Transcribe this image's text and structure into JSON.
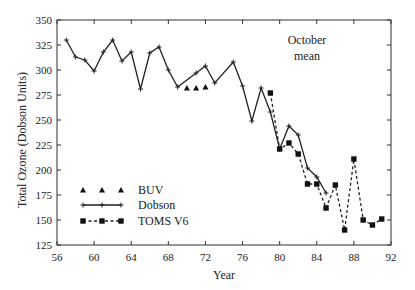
{
  "chart_data": {
    "type": "line",
    "title": "",
    "annotation": [
      "October",
      "mean"
    ],
    "xlabel": "Year",
    "ylabel": "Total Ozone (Dobson Units)",
    "xlim": [
      56,
      92
    ],
    "ylim": [
      125,
      350
    ],
    "xticks": [
      56,
      60,
      64,
      68,
      72,
      76,
      80,
      84,
      88,
      92
    ],
    "yticks": [
      125,
      150,
      175,
      200,
      225,
      250,
      275,
      300,
      325,
      350
    ],
    "grid": false,
    "legend_position": "lower-left",
    "series": [
      {
        "name": "BUV",
        "style": "markers-triangle",
        "x": [
          70,
          71,
          72
        ],
        "values": [
          282,
          282,
          283
        ]
      },
      {
        "name": "Dobson",
        "style": "solid-plus",
        "x": [
          57,
          58,
          59,
          60,
          61,
          62,
          63,
          64,
          65,
          66,
          67,
          68,
          69,
          71,
          72,
          73,
          75,
          76,
          77,
          78,
          79,
          80,
          81,
          82,
          83,
          84,
          85
        ],
        "values": [
          330,
          313,
          310,
          299,
          318,
          330,
          309,
          318,
          281,
          317,
          323,
          300,
          283,
          297,
          304,
          287,
          308,
          284,
          249,
          282,
          258,
          221,
          244,
          235,
          202,
          193,
          177
        ]
      },
      {
        "name": "TOMS V6",
        "style": "dashed-square",
        "x": [
          79,
          80,
          81,
          82,
          83,
          84,
          85,
          86,
          87,
          88,
          89,
          90,
          91
        ],
        "values": [
          277,
          221,
          227,
          216,
          186,
          186,
          162,
          185,
          140,
          211,
          150,
          145,
          151
        ]
      }
    ]
  }
}
